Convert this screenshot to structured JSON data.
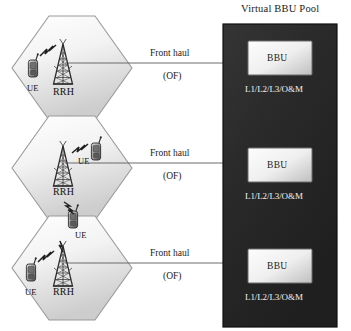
{
  "diagram": {
    "title": "Virtual BBU Pool",
    "cells": [
      {
        "rrh_label": "RRH",
        "ue_labels": [
          "UE"
        ],
        "link": {
          "name": "Front haul",
          "medium": "(OF)"
        }
      },
      {
        "rrh_label": "RRH",
        "ue_labels": [
          "UE",
          "UE"
        ],
        "link": {
          "name": "Front haul",
          "medium": "(OF)"
        }
      },
      {
        "rrh_label": "RRH",
        "ue_labels": [
          "UE"
        ],
        "link": {
          "name": "Front haul",
          "medium": "(OF)"
        }
      }
    ],
    "pool": {
      "title": "Virtual BBU Pool",
      "units": [
        {
          "label": "BBU",
          "functions": "L1/L2/L3/O&M"
        },
        {
          "label": "BBU",
          "functions": "L1/L2/L3/O&M"
        },
        {
          "label": "BBU",
          "functions": "L1/L2/L3/O&M"
        }
      ]
    },
    "colors": {
      "pool_fill": "#2b2b2b",
      "pool_border": "#121212",
      "bbu_fill_light": "#f4f4f4",
      "bbu_fill_dark": "#cfcfcf",
      "bbu_border": "#6d6d6d",
      "hex_fill_light": "#fbfbfb",
      "hex_fill_dark": "#d4d4d4",
      "hex_border": "#9a9a9a",
      "line": "#5c5c5c",
      "text": "#1a1a1a",
      "text_on_dark": "#f2f2f2"
    }
  }
}
